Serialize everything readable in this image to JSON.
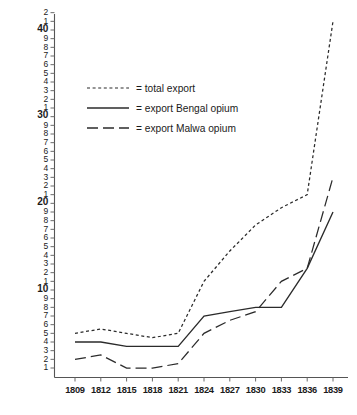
{
  "chart_data": {
    "type": "line",
    "title": "",
    "xlabel": "",
    "ylabel": "",
    "x": [
      1809,
      1812,
      1815,
      1818,
      1821,
      1824,
      1827,
      1830,
      1833,
      1836,
      1839
    ],
    "categories": [
      "1809",
      "1812",
      "1815",
      "1818",
      "1821",
      "1824",
      "1827",
      "1830",
      "1833",
      "1836",
      "1839"
    ],
    "xlim": [
      1808,
      1840
    ],
    "ylim": [
      0,
      42
    ],
    "grid": false,
    "legend_position": "upper-left-inside",
    "y_major_ticks": [
      10,
      20,
      30,
      40
    ],
    "y_tick_labels": [
      "1",
      "2",
      "3",
      "4",
      "5",
      "6",
      "7",
      "8",
      "9",
      "10",
      "1",
      "2",
      "3",
      "4",
      "5",
      "6",
      "7",
      "8",
      "9",
      "20",
      "1",
      "2",
      "3",
      "4",
      "5",
      "6",
      "7",
      "8",
      "9",
      "30",
      "1",
      "2",
      "3",
      "4",
      "5",
      "6",
      "7",
      "8",
      "9",
      "40",
      "1",
      "2"
    ],
    "y_tick_values": [
      1,
      2,
      3,
      4,
      5,
      6,
      7,
      8,
      9,
      10,
      11,
      12,
      13,
      14,
      15,
      16,
      17,
      18,
      19,
      20,
      21,
      22,
      23,
      24,
      25,
      26,
      27,
      28,
      29,
      30,
      31,
      32,
      33,
      34,
      35,
      36,
      37,
      38,
      39,
      40,
      41,
      42
    ],
    "series": [
      {
        "name": "total export",
        "legend_label": "= total export",
        "style": "dotted",
        "values": [
          5,
          5.5,
          5,
          4.5,
          5,
          11,
          14.5,
          17.5,
          19.5,
          21,
          41
        ]
      },
      {
        "name": "export Bengal opium",
        "legend_label": "= export Bengal opium",
        "style": "solid",
        "values": [
          4,
          4,
          3.5,
          3.5,
          3.5,
          7,
          7.5,
          8,
          8,
          12.5,
          19
        ]
      },
      {
        "name": "export Malwa opium",
        "legend_label": "= export Malwa opium",
        "style": "dashed",
        "values": [
          2,
          2.5,
          1,
          1,
          1.5,
          5,
          6.5,
          7.5,
          11,
          12.5,
          23
        ]
      }
    ],
    "colors": {
      "line": "#2b2b2b",
      "axis": "#555555",
      "text": "#1b1b1b",
      "background": "#ffffff"
    }
  }
}
